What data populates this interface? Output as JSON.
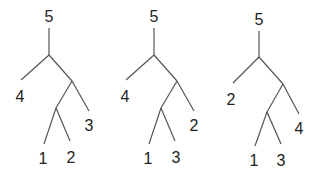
{
  "diagram": {
    "type": "tree-comparison",
    "trees": [
      {
        "root": "5",
        "top_split": {
          "left_leaf": "4",
          "right_subtree": {
            "outer_leaf": "3",
            "inner_pair": [
              "1",
              "2"
            ]
          }
        },
        "labels": {
          "root": "5",
          "a": "4",
          "b": "3",
          "c": "1",
          "d": "2"
        }
      },
      {
        "root": "5",
        "top_split": {
          "left_leaf": "4",
          "right_subtree": {
            "outer_leaf": "2",
            "inner_pair": [
              "1",
              "3"
            ]
          }
        },
        "labels": {
          "root": "5",
          "a": "4",
          "b": "2",
          "c": "1",
          "d": "3"
        }
      },
      {
        "root": "5",
        "top_split": {
          "left_leaf": "2",
          "right_subtree": {
            "outer_leaf": "4",
            "inner_pair": [
              "1",
              "3"
            ]
          }
        },
        "labels": {
          "root": "5",
          "a": "2",
          "b": "4",
          "c": "1",
          "d": "3"
        }
      }
    ]
  }
}
